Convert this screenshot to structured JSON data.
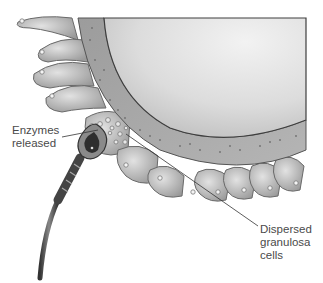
{
  "figure": {
    "labels": {
      "enzymes": [
        "Enzymes",
        "released"
      ],
      "granulosa": [
        "Dispersed",
        "granulosa",
        "cells"
      ]
    },
    "colors": {
      "background": "#ffffff",
      "oocyte": "#d9d9d9",
      "zona": "#a9a9a9",
      "granulosa": "#b8b8b8",
      "outline": "#555555",
      "leader_line": "#333333",
      "label_text": "#4a4a4a"
    }
  }
}
